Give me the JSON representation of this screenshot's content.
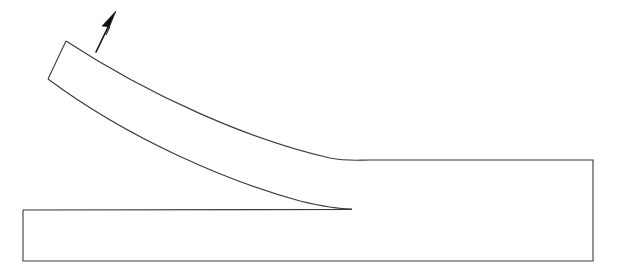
{
  "figure": {
    "width": 624,
    "height": 273,
    "background_color": "#ffffff",
    "line_color": "#3a3a3a",
    "arrow_color": "#111111",
    "line_width": 1.1
  },
  "substrate": {
    "name": "substrate-block",
    "left_x": 23,
    "top_y": 210,
    "bottom_y": 261,
    "right_x": 593,
    "step_top_y": 160,
    "outline_path": "M 23 210 L 352 209.5 M 23 210 L 23 261 L 593 261 L 593 160 L 370 160"
  },
  "peel_strip": {
    "name": "peeling-strip",
    "free_end_top": [
      66,
      41
    ],
    "free_end_bottom": [
      48,
      79
    ],
    "delamination_tip": [
      352,
      209
    ],
    "thickness_px": 42,
    "upper_edge_path": "M 66 41 C 150 96 250 140 330 158 C 348 161.5 360 160 370 160",
    "lower_edge_path": "M 48 79 C 130 140 230 182 300 201 C 325 207 340 209 352 209",
    "end_face_path": "M 66 41 L 48 79"
  },
  "force_arrow": {
    "name": "peel-force-arrow",
    "tail": [
      96,
      52
    ],
    "tip": [
      116,
      11
    ],
    "shaft_path": "M 96 52 L 110 23",
    "head_points": "116,11 102,26 110,27 106,35",
    "direction": "up-left"
  }
}
